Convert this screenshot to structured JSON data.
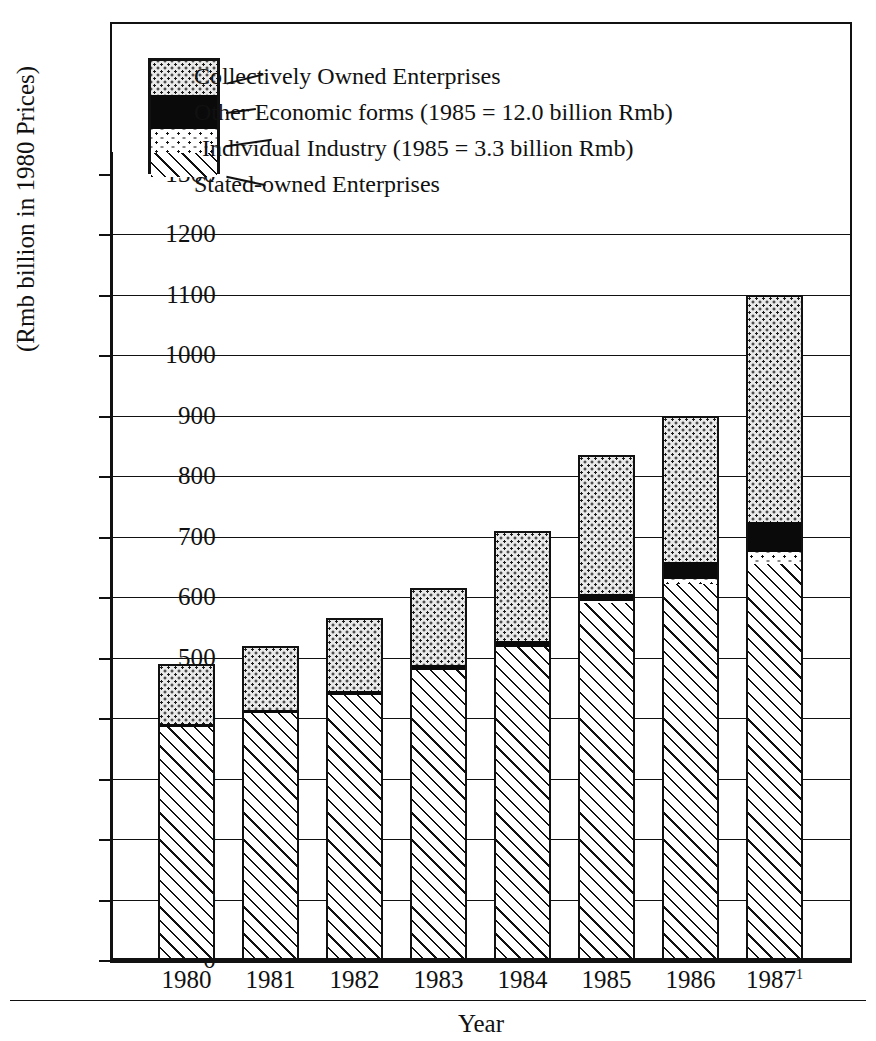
{
  "figure": {
    "y_axis_title": "(Rmb billion in 1980 Prices)",
    "x_axis_title": "Year",
    "footnote_marker": "1"
  },
  "legend": {
    "items": [
      {
        "key": "collective",
        "label": "Collectively Owned Enterprises",
        "pattern": "dense-dot-screen"
      },
      {
        "key": "other",
        "label": "Other Economic forms (1985 = 12.0 billion Rmb)",
        "pattern": "solid-black"
      },
      {
        "key": "individual",
        "label": "Individual Industry (1985 = 3.3 billion Rmb)",
        "pattern": "sparse-dots"
      },
      {
        "key": "state",
        "label": "Stated-owned Enterprises",
        "pattern": "diagonal-hatch"
      }
    ]
  },
  "axis": {
    "y_ticks": [
      "1300",
      "1200",
      "1100",
      "1000",
      "900",
      "800",
      "700",
      "600",
      "500",
      "400",
      "300",
      "200",
      "100",
      "0"
    ],
    "x_ticks": [
      "1980",
      "1981",
      "1982",
      "1983",
      "1984",
      "1985",
      "1986",
      "1987"
    ]
  },
  "chart_data": {
    "type": "bar",
    "subtype": "stacked",
    "title": "",
    "xlabel": "Year",
    "ylabel": "(Rmb billion in 1980 Prices)",
    "ylim": [
      0,
      1300
    ],
    "ytick_step": 100,
    "grid": true,
    "legend_position": "top-left",
    "categories": [
      "1980",
      "1981",
      "1982",
      "1983",
      "1984",
      "1985",
      "1986",
      "1987"
    ],
    "series": [
      {
        "name": "Stated-owned Enterprises",
        "key": "state",
        "values": [
          385,
          408,
          438,
          480,
          518,
          590,
          622,
          655
        ]
      },
      {
        "name": "Individual Industry",
        "key": "individual",
        "values": [
          0,
          0,
          0,
          0,
          0,
          3.3,
          9,
          20
        ]
      },
      {
        "name": "Other Economic forms",
        "key": "other",
        "values": [
          6,
          6,
          7,
          8,
          10,
          12,
          28,
          50
        ]
      },
      {
        "name": "Collectively Owned Enterprises",
        "key": "collective",
        "values": [
          99,
          106,
          120,
          127,
          182,
          230,
          240,
          375
        ]
      }
    ],
    "totals": [
      490,
      520,
      565,
      615,
      710,
      835,
      899,
      1100
    ],
    "annotations": [
      "Other Economic forms (1985 = 12.0 billion Rmb)",
      "Individual Industry (1985 = 3.3 billion Rmb)"
    ],
    "footnotes": [
      "1987 figure marked with superscript 1"
    ]
  },
  "colors": {
    "ink": "#111111",
    "paper": "#ffffff",
    "collective_fill": "#e9e9e9",
    "other_fill": "#0a0a0a"
  }
}
